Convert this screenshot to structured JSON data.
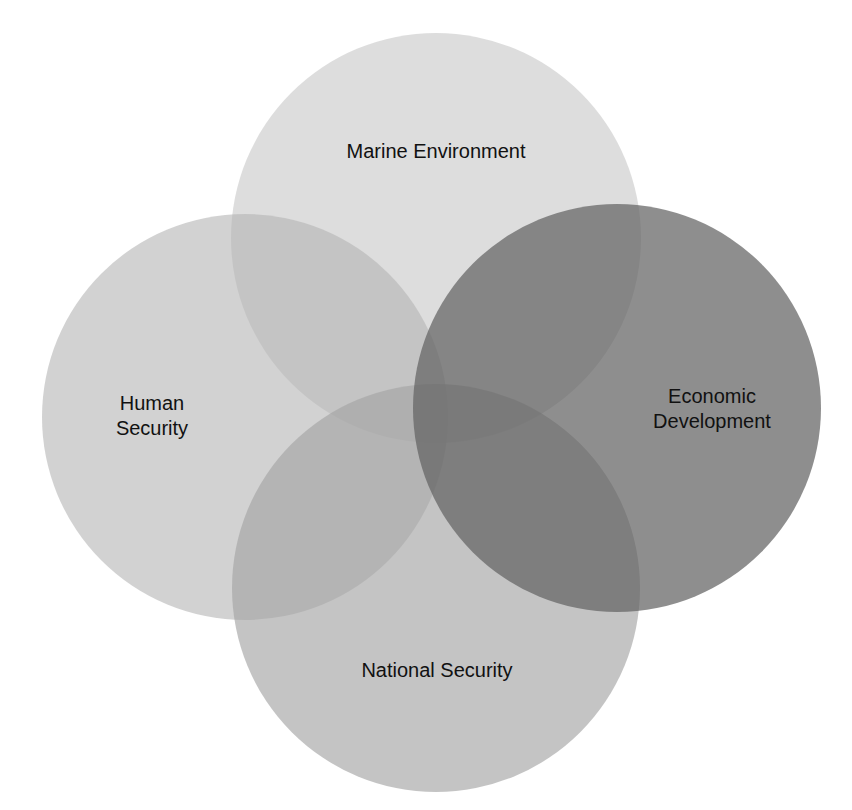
{
  "diagram": {
    "type": "venn",
    "circles": [
      {
        "id": "marine",
        "label_lines": [
          "Marine Environment"
        ],
        "cx": 436,
        "cy": 238,
        "r": 205,
        "color": "#c8c8c8",
        "opacity": 0.55,
        "label_x": 436,
        "label_y": 158
      },
      {
        "id": "human",
        "label_lines": [
          "Human",
          "Security"
        ],
        "cx": 245,
        "cy": 417,
        "r": 203,
        "color": "#b8b8b8",
        "opacity": 0.6,
        "label_x": 152,
        "label_y": 410
      },
      {
        "id": "national",
        "label_lines": [
          "National Security"
        ],
        "cx": 436,
        "cy": 588,
        "r": 204,
        "color": "#a8a8a8",
        "opacity": 0.65,
        "label_x": 437,
        "label_y": 677
      },
      {
        "id": "economic",
        "label_lines": [
          "Economic",
          "Development"
        ],
        "cx": 617,
        "cy": 408,
        "r": 204,
        "color": "#6e6e6e",
        "opacity": 0.75,
        "label_x": 712,
        "label_y": 400
      }
    ]
  },
  "labels": {
    "marine": "Marine Environment",
    "human_1": "Human",
    "human_2": "Security",
    "economic_1": "Economic",
    "economic_2": "Development",
    "national": "National Security"
  }
}
